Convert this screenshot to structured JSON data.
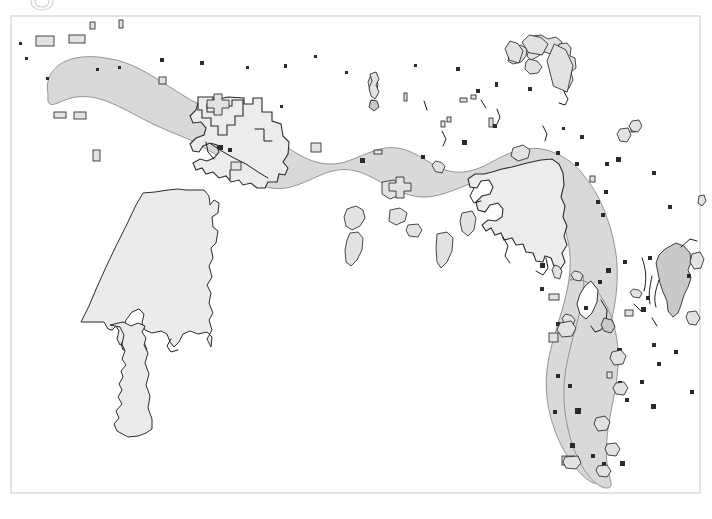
{
  "figure": {
    "kind": "map",
    "title": "",
    "caption": "",
    "width": 712,
    "height": 519,
    "background_color": "#ffffff"
  },
  "frame": {
    "name": "map-border",
    "x": 11,
    "y": 16,
    "width": 689,
    "height": 477,
    "stroke_color": "#d0d0d0",
    "fill": "none"
  },
  "legend": {
    "visible": false,
    "entries": []
  },
  "scalebar": {
    "visible": false,
    "label": ""
  },
  "north_arrow": {
    "visible": false,
    "label": ""
  },
  "axes": {
    "visible": false,
    "x_ticks": [],
    "y_ticks": []
  },
  "colors": {
    "main_band_fill": "#d9d9d9",
    "main_band_stroke": "#8a8a8a",
    "light_region_fill": "#ececec",
    "outline_stroke": "#2b2b2b",
    "islet_fill": "#e2e2e2",
    "islet_stroke": "#1c1c1c",
    "frame_stroke": "#d0d0d0",
    "page_background": "#ffffff"
  },
  "layers": {
    "main_band": {
      "name": "main-shaded-band",
      "label": "",
      "path": "M 47 95 C 44 82 50 68 63 62 C 76 56 92 57 106 60 C 122 63 136 70 150 78 C 166 87 180 97 196 105 C 210 112 224 117 239 122 C 252 126 262 132 272 140 C 282 148 292 155 304 160 C 316 165 329 166 341 163 C 352 160 362 155 373 152 C 385 149 397 151 408 156 C 419 161 429 168 441 171 C 452 174 464 172 475 168 C 487 163 498 157 510 154 C 522 151 534 152 545 156 C 556 160 565 167 573 176 C 582 186 589 198 594 211 C 600 225 604 240 606 255 C 608 271 607 287 603 302 C 599 316 592 329 587 343 C 582 357 579 372 579 387 C 579 402 582 416 587 429 C 592 441 600 452 606 464 C 612 476 615 483 610 482 C 604 481 596 474 589 465 C 580 453 573 439 569 424 C 564 408 563 391 565 375 C 567 358 572 342 577 326 C 581 312 585 298 586 284 C 587 269 585 254 580 240 C 575 226 567 214 558 204 C 548 194 536 187 523 185 C 510 183 497 186 485 191 C 472 196 461 203 448 206 C 435 209 422 207 410 202 C 398 197 388 190 377 185 C 366 180 354 178 343 181 C 331 184 321 190 310 194 C 298 198 285 198 273 194 C 261 190 251 183 241 175 C 231 167 221 160 209 154 C 196 148 182 144 169 138 C 155 132 142 124 129 117 C 115 109 101 102 86 99 C 73 96 60 99 52 104 C 47 107 45 101 47 95 Z",
      "interactable": false
    },
    "band_lower_lobe": {
      "name": "main-band-lower-lobe",
      "label": "",
      "path": "M 563 281 C 570 279 578 281 584 287 C 591 294 596 303 599 313 C 603 326 604 340 603 354 C 602 372 598 389 596 406 C 594 423 594 440 598 456 C 601 468 606 477 607 482 C 602 482 594 474 588 464 C 580 451 574 436 570 420 C 566 403 565 386 567 369 C 569 352 574 336 578 320 C 581 308 583 296 582 285 C 581 279 560 282 563 281 Z",
      "interactable": false
    },
    "western_inset_region": {
      "name": "western-inset-region",
      "label": "",
      "path": "M 185 187 L 205 187 L 212 194 L 213 204 L 216 200 L 220 202 L 220 212 L 214 216 L 214 226 L 219 230 L 218 241 L 213 246 L 215 257 L 212 264 L 214 276 L 210 284 L 215 292 L 213 301 L 216 311 L 212 318 L 215 327 L 210 336 L 214 345 L 209 352 L 212 341 L 206 335 L 198 337 L 190 334 L 184 337 L 181 345 L 176 349 L 172 344 L 170 336 L 164 333 L 155 335 L 148 332 L 145 325 L 147 317 L 143 312 L 136 315 L 129 322 L 126 331 L 128 340 L 124 346 L 126 352 L 131 350 L 137 352 L 135 345 L 140 341 L 146 344 L 149 352 L 145 356 L 138 355 L 134 360 L 132 348 L 127 344 L 122 347 L 119 341 L 121 333 L 118 328 L 114 332 L 110 331 L 106 324 L 83 324 L 90 308 L 97 290 L 105 272 L 114 252 L 124 231 L 133 212 L 141 196 L 152 195 L 165 192 L 177 189 Z",
      "interactable": false
    },
    "western_inset_tail": {
      "name": "western-inset-tail",
      "label": "",
      "path": "M 112 326 L 122 328 L 126 336 L 124 345 L 127 352 L 124 360 L 128 366 L 123 372 L 125 378 L 121 385 L 124 391 L 120 398 L 124 405 L 118 412 L 121 419 L 116 425 L 119 432 L 130 438 L 140 437 L 148 434 L 154 430 L 154 420 L 150 409 L 152 397 L 148 386 L 151 375 L 147 364 L 150 354 L 146 346 L 148 339 L 144 333 L 147 327 L 140 324 L 133 327 L 125 323 Z",
      "interactable": false
    },
    "central_light_region": {
      "name": "central-light-region",
      "label": "",
      "path": "M 203 97 L 219 98 L 228 96 L 244 97 L 244 103 L 254 103 L 254 97 L 263 97 L 263 110 L 272 110 L 272 119 L 281 122 L 283 134 L 289 140 L 288 152 L 283 160 L 288 166 L 285 173 L 279 172 L 277 180 L 268 180 L 265 186 L 257 186 L 251 181 L 243 183 L 239 178 L 231 180 L 226 174 L 219 176 L 213 170 L 206 172 L 202 166 L 196 168 L 193 161 L 200 157 L 207 159 L 214 156 L 219 150 L 217 143 L 210 141 L 203 144 L 199 150 L 193 149 L 190 142 L 196 136 L 204 133 L 206 126 L 201 120 L 193 121 L 190 114 L 196 108 L 198 101 Z",
      "interactable": false
    },
    "central_light_region_b": {
      "name": "central-light-region-secondary",
      "label": "",
      "path": "M 198 95 L 214 95 L 214 102 L 208 102 L 208 110 L 220 110 L 220 104 L 233 104 L 233 98 L 244 98 L 244 114 L 236 114 L 236 123 L 228 123 L 228 133 L 219 133 L 219 124 L 212 124 L 212 116 L 203 116 L 203 108 L 198 108 Z",
      "interactable": false
    },
    "eastern_light_region": {
      "name": "eastern-light-region",
      "label": "",
      "path": "M 513 164 L 528 161 L 542 158 L 553 157 L 560 161 L 564 170 L 565 182 L 562 194 L 566 203 L 564 214 L 568 223 L 565 233 L 568 241 L 563 249 L 566 258 L 561 266 L 555 262 L 552 254 L 546 252 L 544 258 L 537 257 L 534 249 L 527 248 L 524 240 L 517 241 L 513 234 L 505 236 L 502 229 L 496 231 L 492 224 L 487 227 L 483 221 L 489 216 L 497 217 L 503 213 L 504 205 L 499 199 L 491 201 L 486 208 L 479 206 L 477 198 L 483 192 L 491 190 L 494 183 L 490 176 L 482 177 L 478 184 L 471 183 L 469 175 L 476 170 L 485 170 L 493 168 L 503 166 Z",
      "interactable": false
    },
    "eastern_light_region_inner": {
      "name": "eastern-light-region-inner",
      "label": "",
      "path": "M 519 170 L 536 168 L 548 166 L 556 170 L 558 180 L 555 191 L 558 201 L 556 212 L 559 222 L 556 232 L 559 242 L 554 250 L 547 246 L 543 238 L 536 239 L 532 232 L 525 233 L 522 226 L 515 227 L 512 220 L 516 214 L 523 213 L 526 206 L 522 199 L 514 200 L 510 207 L 503 205 L 502 197 L 508 191 L 516 191 L 519 183 L 515 177 Z",
      "interactable": false
    },
    "far_east_island": {
      "name": "far-east-island",
      "label": "",
      "path": "M 676 243 L 684 246 L 690 253 L 691 262 L 688 270 L 691 278 L 688 286 L 684 294 L 680 303 L 678 312 L 673 316 L 668 311 L 667 301 L 663 292 L 660 283 L 658 273 L 656 263 L 659 255 L 665 249 Z",
      "interactable": false
    }
  },
  "islets": {
    "name": "small-islet-polygons",
    "count": 96,
    "items": [
      {
        "x": 36,
        "y": 36,
        "w": 18,
        "h": 10,
        "k": "rect"
      },
      {
        "x": 90,
        "y": 22,
        "w": 5,
        "h": 7,
        "k": "rect"
      },
      {
        "x": 119,
        "y": 20,
        "w": 4,
        "h": 8,
        "k": "rect"
      },
      {
        "x": 69,
        "y": 35,
        "w": 16,
        "h": 8,
        "k": "rect"
      },
      {
        "x": 19,
        "y": 42,
        "w": 3,
        "h": 3,
        "k": "dot"
      },
      {
        "x": 25,
        "y": 57,
        "w": 3,
        "h": 3,
        "k": "dot"
      },
      {
        "x": 46,
        "y": 77,
        "w": 3,
        "h": 3,
        "k": "dot"
      },
      {
        "x": 96,
        "y": 68,
        "w": 3,
        "h": 3,
        "k": "dot"
      },
      {
        "x": 54,
        "y": 112,
        "w": 12,
        "h": 6,
        "k": "rect"
      },
      {
        "x": 74,
        "y": 112,
        "w": 12,
        "h": 7,
        "k": "rect"
      },
      {
        "x": 93,
        "y": 150,
        "w": 7,
        "h": 11,
        "k": "rect"
      },
      {
        "x": 118,
        "y": 66,
        "w": 3,
        "h": 3,
        "k": "dot"
      },
      {
        "x": 159,
        "y": 77,
        "w": 7,
        "h": 7,
        "k": "rect"
      },
      {
        "x": 160,
        "y": 58,
        "w": 4,
        "h": 4,
        "k": "dot"
      },
      {
        "x": 200,
        "y": 61,
        "w": 4,
        "h": 4,
        "k": "dot"
      },
      {
        "x": 218,
        "y": 145,
        "w": 5,
        "h": 5,
        "k": "dot"
      },
      {
        "x": 228,
        "y": 148,
        "w": 4,
        "h": 4,
        "k": "dot"
      },
      {
        "x": 246,
        "y": 66,
        "w": 3,
        "h": 3,
        "k": "dot"
      },
      {
        "x": 284,
        "y": 64,
        "w": 3,
        "h": 4,
        "k": "dot"
      },
      {
        "x": 314,
        "y": 55,
        "w": 3,
        "h": 3,
        "k": "dot"
      },
      {
        "x": 311,
        "y": 143,
        "w": 10,
        "h": 9,
        "k": "rect"
      },
      {
        "x": 280,
        "y": 105,
        "w": 3,
        "h": 3,
        "k": "dot"
      },
      {
        "x": 345,
        "y": 71,
        "w": 3,
        "h": 3,
        "k": "dot"
      },
      {
        "x": 368,
        "y": 75,
        "w": 10,
        "h": 20,
        "k": "poly"
      },
      {
        "x": 370,
        "y": 100,
        "w": 7,
        "h": 8,
        "k": "poly"
      },
      {
        "x": 374,
        "y": 150,
        "w": 8,
        "h": 4,
        "k": "rect"
      },
      {
        "x": 360,
        "y": 158,
        "w": 5,
        "h": 5,
        "k": "dot"
      },
      {
        "x": 404,
        "y": 93,
        "w": 3,
        "h": 8,
        "k": "rect"
      },
      {
        "x": 414,
        "y": 64,
        "w": 3,
        "h": 3,
        "k": "dot"
      },
      {
        "x": 421,
        "y": 155,
        "w": 4,
        "h": 4,
        "k": "dot"
      },
      {
        "x": 432,
        "y": 161,
        "w": 13,
        "h": 12,
        "k": "poly"
      },
      {
        "x": 441,
        "y": 121,
        "w": 4,
        "h": 6,
        "k": "rect"
      },
      {
        "x": 447,
        "y": 117,
        "w": 4,
        "h": 5,
        "k": "rect"
      },
      {
        "x": 460,
        "y": 98,
        "w": 7,
        "h": 4,
        "k": "rect"
      },
      {
        "x": 471,
        "y": 95,
        "w": 5,
        "h": 4,
        "k": "rect"
      },
      {
        "x": 456,
        "y": 67,
        "w": 4,
        "h": 4,
        "k": "dot"
      },
      {
        "x": 476,
        "y": 89,
        "w": 4,
        "h": 4,
        "k": "dot"
      },
      {
        "x": 462,
        "y": 140,
        "w": 5,
        "h": 5,
        "k": "dot"
      },
      {
        "x": 489,
        "y": 118,
        "w": 4,
        "h": 9,
        "k": "rect"
      },
      {
        "x": 505,
        "y": 41,
        "w": 18,
        "h": 22,
        "k": "poly"
      },
      {
        "x": 522,
        "y": 35,
        "w": 26,
        "h": 20,
        "k": "poly"
      },
      {
        "x": 547,
        "y": 44,
        "w": 26,
        "h": 48,
        "k": "poly"
      },
      {
        "x": 495,
        "y": 82,
        "w": 3,
        "h": 5,
        "k": "dot"
      },
      {
        "x": 528,
        "y": 87,
        "w": 4,
        "h": 4,
        "k": "dot"
      },
      {
        "x": 493,
        "y": 124,
        "w": 4,
        "h": 4,
        "k": "dot"
      },
      {
        "x": 515,
        "y": 156,
        "w": 4,
        "h": 4,
        "k": "dot"
      },
      {
        "x": 556,
        "y": 151,
        "w": 4,
        "h": 4,
        "k": "dot"
      },
      {
        "x": 575,
        "y": 162,
        "w": 4,
        "h": 4,
        "k": "dot"
      },
      {
        "x": 590,
        "y": 176,
        "w": 5,
        "h": 6,
        "k": "rect"
      },
      {
        "x": 596,
        "y": 200,
        "w": 4,
        "h": 4,
        "k": "dot"
      },
      {
        "x": 604,
        "y": 190,
        "w": 4,
        "h": 4,
        "k": "dot"
      },
      {
        "x": 601,
        "y": 213,
        "w": 4,
        "h": 4,
        "k": "dot"
      },
      {
        "x": 621,
        "y": 132,
        "w": 5,
        "h": 8,
        "k": "rect"
      },
      {
        "x": 631,
        "y": 126,
        "w": 4,
        "h": 6,
        "k": "rect"
      },
      {
        "x": 652,
        "y": 171,
        "w": 4,
        "h": 4,
        "k": "dot"
      },
      {
        "x": 668,
        "y": 205,
        "w": 4,
        "h": 4,
        "k": "dot"
      },
      {
        "x": 580,
        "y": 135,
        "w": 4,
        "h": 4,
        "k": "dot"
      },
      {
        "x": 562,
        "y": 127,
        "w": 3,
        "h": 3,
        "k": "dot"
      },
      {
        "x": 605,
        "y": 162,
        "w": 4,
        "h": 4,
        "k": "dot"
      },
      {
        "x": 616,
        "y": 157,
        "w": 5,
        "h": 5,
        "k": "dot"
      },
      {
        "x": 540,
        "y": 263,
        "w": 5,
        "h": 5,
        "k": "dot"
      },
      {
        "x": 552,
        "y": 265,
        "w": 10,
        "h": 14,
        "k": "poly"
      },
      {
        "x": 571,
        "y": 271,
        "w": 12,
        "h": 10,
        "k": "poly"
      },
      {
        "x": 606,
        "y": 268,
        "w": 5,
        "h": 5,
        "k": "dot"
      },
      {
        "x": 540,
        "y": 287,
        "w": 4,
        "h": 4,
        "k": "dot"
      },
      {
        "x": 549,
        "y": 294,
        "w": 10,
        "h": 6,
        "k": "rect"
      },
      {
        "x": 562,
        "y": 314,
        "w": 13,
        "h": 13,
        "k": "poly"
      },
      {
        "x": 556,
        "y": 322,
        "w": 4,
        "h": 4,
        "k": "dot"
      },
      {
        "x": 598,
        "y": 280,
        "w": 4,
        "h": 4,
        "k": "dot"
      },
      {
        "x": 623,
        "y": 260,
        "w": 4,
        "h": 4,
        "k": "dot"
      },
      {
        "x": 648,
        "y": 256,
        "w": 4,
        "h": 4,
        "k": "dot"
      },
      {
        "x": 630,
        "y": 289,
        "w": 12,
        "h": 9,
        "k": "poly"
      },
      {
        "x": 646,
        "y": 296,
        "w": 4,
        "h": 4,
        "k": "dot"
      },
      {
        "x": 625,
        "y": 310,
        "w": 8,
        "h": 6,
        "k": "rect"
      },
      {
        "x": 641,
        "y": 307,
        "w": 5,
        "h": 5,
        "k": "dot"
      },
      {
        "x": 652,
        "y": 343,
        "w": 4,
        "h": 4,
        "k": "dot"
      },
      {
        "x": 657,
        "y": 362,
        "w": 4,
        "h": 4,
        "k": "dot"
      },
      {
        "x": 617,
        "y": 348,
        "w": 5,
        "h": 5,
        "k": "dot"
      },
      {
        "x": 607,
        "y": 372,
        "w": 5,
        "h": 6,
        "k": "rect"
      },
      {
        "x": 618,
        "y": 381,
        "w": 4,
        "h": 4,
        "k": "dot"
      },
      {
        "x": 640,
        "y": 380,
        "w": 4,
        "h": 4,
        "k": "dot"
      },
      {
        "x": 651,
        "y": 404,
        "w": 5,
        "h": 5,
        "k": "dot"
      },
      {
        "x": 625,
        "y": 398,
        "w": 4,
        "h": 4,
        "k": "dot"
      },
      {
        "x": 549,
        "y": 333,
        "w": 9,
        "h": 9,
        "k": "rect"
      },
      {
        "x": 556,
        "y": 374,
        "w": 4,
        "h": 4,
        "k": "dot"
      },
      {
        "x": 553,
        "y": 410,
        "w": 4,
        "h": 4,
        "k": "dot"
      },
      {
        "x": 568,
        "y": 384,
        "w": 4,
        "h": 4,
        "k": "dot"
      },
      {
        "x": 575,
        "y": 408,
        "w": 6,
        "h": 6,
        "k": "dot"
      },
      {
        "x": 570,
        "y": 443,
        "w": 5,
        "h": 5,
        "k": "dot"
      },
      {
        "x": 591,
        "y": 454,
        "w": 4,
        "h": 4,
        "k": "dot"
      },
      {
        "x": 562,
        "y": 456,
        "w": 12,
        "h": 9,
        "k": "rect"
      },
      {
        "x": 602,
        "y": 462,
        "w": 4,
        "h": 4,
        "k": "dot"
      },
      {
        "x": 620,
        "y": 461,
        "w": 5,
        "h": 5,
        "k": "dot"
      },
      {
        "x": 584,
        "y": 306,
        "w": 4,
        "h": 4,
        "k": "dot"
      },
      {
        "x": 674,
        "y": 350,
        "w": 4,
        "h": 4,
        "k": "dot"
      },
      {
        "x": 687,
        "y": 274,
        "w": 4,
        "h": 4,
        "k": "dot"
      },
      {
        "x": 690,
        "y": 390,
        "w": 4,
        "h": 4,
        "k": "dot"
      }
    ]
  },
  "partial_glyph_top": {
    "name": "cropped-glyph-top-edge",
    "visible": true,
    "x": 30,
    "y": -6,
    "rx": 11,
    "ry": 8
  }
}
